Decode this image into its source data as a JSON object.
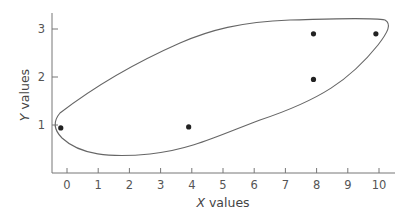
{
  "chart_data": {
    "type": "scatter",
    "title": "",
    "xlabel_var": "X",
    "xlabel_rest": " values",
    "ylabel_var": "Y",
    "ylabel_rest": " values",
    "xlim": [
      -0.5,
      10.5
    ],
    "ylim": [
      0,
      3.3
    ],
    "x_ticks": [
      0,
      1,
      2,
      3,
      4,
      5,
      6,
      7,
      8,
      9,
      10
    ],
    "y_ticks": [
      1,
      2,
      3
    ],
    "grid": false,
    "legend": null,
    "series": [
      {
        "name": "points",
        "x": [
          -0.2,
          3.9,
          7.9,
          7.9,
          9.9
        ],
        "y": [
          0.94,
          0.96,
          1.95,
          2.9,
          2.9
        ]
      }
    ],
    "annotations": [
      {
        "type": "enclosing-loop",
        "description": "hand-drawn closed curve enclosing all points"
      }
    ]
  },
  "colors": {
    "axis": "#777777",
    "points": "#222222",
    "loop": "#666666",
    "text": "#555555"
  }
}
